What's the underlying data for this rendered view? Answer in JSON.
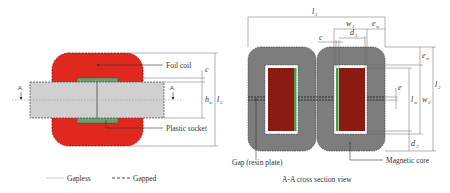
{
  "figure": {
    "left_view": {
      "labels": {
        "foil_coil": "Foil coil",
        "plastic_socket": "Plastic socket",
        "section_marker_left": "A",
        "section_marker_right": "A"
      },
      "dimensions": {
        "c": "c",
        "hw": "h",
        "hw_sub": "w",
        "l3": "l",
        "l3_sub": "3"
      }
    },
    "right_view": {
      "labels": {
        "gap": "Gap (resin plate)",
        "magnetic_core": "Magnetic core"
      },
      "dimensions": {
        "l1": "l",
        "l1_sub": "1",
        "w1": "w",
        "w1_sub": "1",
        "ew_top": "e",
        "ew_top_sub": "w",
        "c": "c",
        "d1": "d",
        "d1_sub": "1",
        "ew_side": "e",
        "ew_side_sub": "w",
        "e": "e",
        "lw": "l",
        "lw_sub": "w",
        "w2": "w",
        "w2_sub": "2",
        "l2": "l",
        "l2_sub": "2",
        "d2": "d",
        "d2_sub": "2"
      },
      "caption": "A-A cross section view"
    },
    "legend": [
      {
        "label": "Gapless",
        "style": "solid"
      },
      {
        "label": "Gapped",
        "style": "dashed"
      }
    ],
    "colors": {
      "foil_coil": "#e0281e",
      "core_light": "#cfcfcf",
      "core_dark": "#7a7a7a",
      "winding": "#8b1a12",
      "socket": "#5a9a5a",
      "gap_line": "#222222"
    }
  }
}
